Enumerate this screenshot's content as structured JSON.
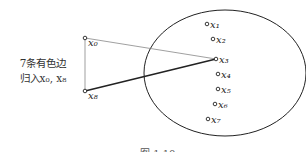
{
  "figure": {
    "side_label_line1": "7条有色边",
    "side_label_line2": "归入x₀, x₈",
    "caption": "图 1.10",
    "outer_nodes": [
      {
        "id": "x0",
        "label": "x₀",
        "x": 85,
        "y": 38
      },
      {
        "id": "x8",
        "label": "x₈",
        "x": 85,
        "y": 91
      }
    ],
    "inner_nodes": [
      {
        "id": "x1",
        "label": "x₁",
        "x": 207,
        "y": 24
      },
      {
        "id": "x2",
        "label": "x₂",
        "x": 213,
        "y": 39
      },
      {
        "id": "x3",
        "label": "x₃",
        "x": 216,
        "y": 59
      },
      {
        "id": "x4",
        "label": "x₄",
        "x": 218,
        "y": 74
      },
      {
        "id": "x5",
        "label": "x₅",
        "x": 218,
        "y": 89
      },
      {
        "id": "x6",
        "label": "x₆",
        "x": 215,
        "y": 104
      },
      {
        "id": "x7",
        "label": "x₇",
        "x": 208,
        "y": 119
      }
    ],
    "edges": [
      {
        "from": "x0",
        "to": "x8",
        "style": "thin"
      },
      {
        "from": "x0",
        "to": "x3",
        "style": "thin"
      },
      {
        "from": "x8",
        "to": "x3",
        "style": "thick"
      }
    ],
    "colors": {
      "line": "#222222",
      "thin_line": "#666666"
    }
  }
}
